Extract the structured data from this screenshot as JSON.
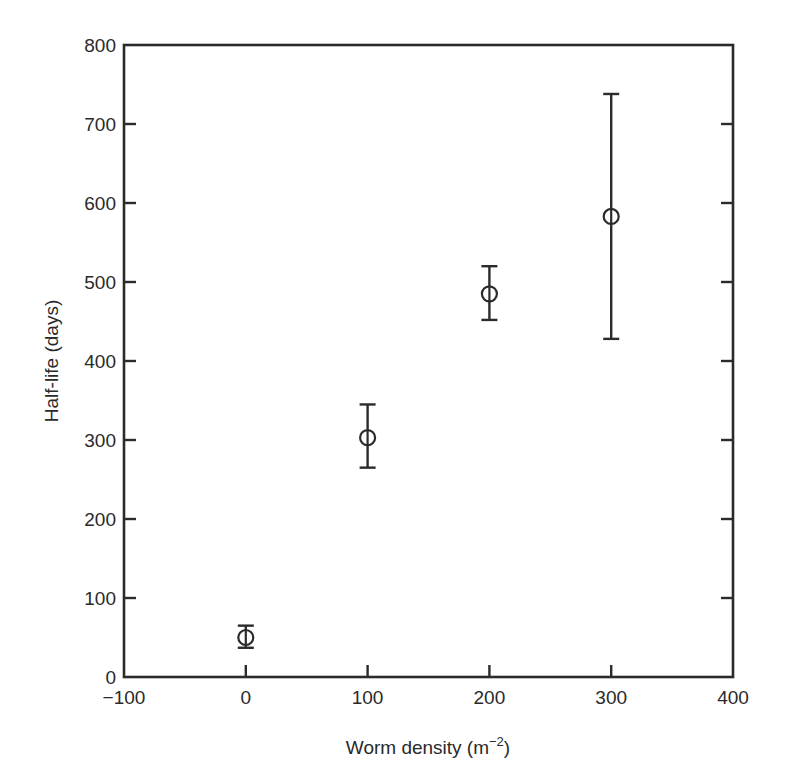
{
  "chart_data": {
    "type": "scatter",
    "title": "",
    "xlabel": "Worm density (m⁻²)",
    "xlabel_main": "Worm density (m",
    "xlabel_sup": "−2",
    "xlabel_close": ")",
    "ylabel": "Half-life (days)",
    "xlim": [
      -100,
      400
    ],
    "ylim": [
      0,
      800
    ],
    "xticks": [
      -100,
      0,
      100,
      200,
      300,
      400
    ],
    "xtick_labels": [
      "−100",
      "0",
      "100",
      "200",
      "300",
      "400"
    ],
    "yticks": [
      0,
      100,
      200,
      300,
      400,
      500,
      600,
      700,
      800
    ],
    "ytick_labels": [
      "0",
      "100",
      "200",
      "300",
      "400",
      "500",
      "600",
      "700",
      "800"
    ],
    "grid": false,
    "legend": null,
    "marker": "open-circle",
    "series": [
      {
        "name": "Half-life",
        "x": [
          0,
          100,
          200,
          300
        ],
        "y": [
          50,
          303,
          485,
          583
        ],
        "error_low": [
          37,
          265,
          452,
          428
        ],
        "error_high": [
          65,
          345,
          520,
          738
        ]
      }
    ]
  }
}
